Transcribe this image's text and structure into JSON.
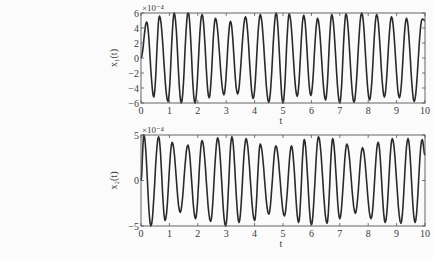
{
  "chart_data": [
    {
      "type": "line",
      "title": "",
      "xlabel": "t",
      "ylabel": "x1(t)",
      "ylabel_display": "x₁(t)",
      "y_exponent_label": "×10⁻⁴",
      "xlim": [
        0,
        10
      ],
      "ylim": [
        -6,
        6
      ],
      "xticks": [
        0,
        1,
        2,
        3,
        4,
        5,
        6,
        7,
        8,
        9,
        10
      ],
      "yticks": [
        -6,
        -4,
        -2,
        0,
        2,
        4,
        6
      ],
      "yticklabels": [
        "−6",
        "−4",
        "−2",
        "0",
        "2",
        "4",
        "6"
      ],
      "grid": false,
      "series": [
        {
          "name": "x1(t)",
          "unit_scale": 0.0001,
          "peaks_t": [
            0.2,
            0.65,
            1.17,
            1.66,
            2.15,
            2.62,
            3.15,
            3.68,
            4.2,
            4.76,
            5.22,
            5.73,
            6.22,
            6.72,
            7.22,
            7.77,
            8.3,
            8.82,
            9.35,
            9.9
          ],
          "peaks_v": [
            4.8,
            5.6,
            6.0,
            6.2,
            5.8,
            5.3,
            4.9,
            5.5,
            5.8,
            6.0,
            5.9,
            5.7,
            5.3,
            5.8,
            5.9,
            6.0,
            5.8,
            5.5,
            5.3,
            5.2
          ],
          "troughs_t": [
            0.45,
            0.95,
            1.42,
            1.9,
            2.4,
            2.92,
            3.4,
            3.95,
            4.5,
            5.0,
            5.5,
            5.98,
            6.5,
            7.0,
            7.5,
            8.05,
            8.57,
            9.1,
            9.62
          ],
          "troughs_v": [
            -5.2,
            -5.8,
            -6.0,
            -6.0,
            -5.3,
            -4.9,
            -4.8,
            -5.4,
            -5.9,
            -6.0,
            -5.1,
            -5.0,
            -5.6,
            -6.0,
            -5.9,
            -5.6,
            -5.2,
            -5.3,
            -5.8
          ],
          "start_value": 0.0,
          "end_value": 5.0
        }
      ]
    },
    {
      "type": "line",
      "title": "",
      "xlabel": "t",
      "ylabel": "x2(t)",
      "ylabel_display": "x₂(t)",
      "y_exponent_label": "×10⁻⁴",
      "xlim": [
        0,
        10
      ],
      "ylim": [
        -5,
        5
      ],
      "xticks": [
        0,
        1,
        2,
        3,
        4,
        5,
        6,
        7,
        8,
        9,
        10
      ],
      "yticks": [
        -5,
        0,
        5
      ],
      "yticklabels": [
        "−5",
        "0",
        "5"
      ],
      "grid": false,
      "series": [
        {
          "name": "x2(t)",
          "unit_scale": 0.0001,
          "peaks_t": [
            0.1,
            0.62,
            1.1,
            1.65,
            2.15,
            2.7,
            3.2,
            3.7,
            4.2,
            4.75,
            5.3,
            5.75,
            6.25,
            6.75,
            7.25,
            7.8,
            8.35,
            8.85,
            9.4,
            9.9
          ],
          "peaks_v": [
            5.0,
            4.8,
            4.2,
            3.9,
            4.4,
            4.7,
            4.8,
            4.6,
            4.0,
            3.8,
            3.8,
            4.5,
            4.8,
            4.6,
            4.0,
            3.6,
            4.2,
            4.6,
            4.6,
            4.5
          ],
          "troughs_t": [
            0.35,
            0.85,
            1.38,
            1.92,
            2.45,
            2.98,
            3.45,
            4.0,
            4.5,
            5.05,
            5.55,
            6.0,
            6.55,
            7.0,
            7.55,
            8.1,
            8.6,
            9.15,
            9.65
          ],
          "troughs_v": [
            -5.0,
            -4.4,
            -3.5,
            -4.2,
            -4.5,
            -5.0,
            -4.6,
            -4.4,
            -3.7,
            -3.9,
            -4.6,
            -4.9,
            -4.7,
            -4.2,
            -3.6,
            -4.2,
            -4.6,
            -4.7,
            -4.6
          ],
          "start_value": 0.0,
          "end_value": 2.8
        }
      ]
    }
  ]
}
